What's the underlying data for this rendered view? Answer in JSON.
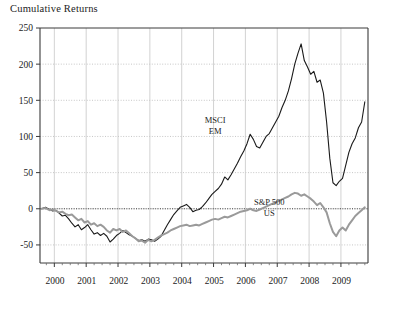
{
  "chart_data": {
    "type": "line",
    "title": "Cumulative Returns",
    "xlabel": "",
    "ylabel": "",
    "ylim": [
      -75,
      250
    ],
    "xlim": [
      1999.55,
      2009.85
    ],
    "grid": true,
    "legend_position": "inline-annotation",
    "yticks": [
      250,
      200,
      150,
      100,
      50,
      0,
      -50
    ],
    "ytick_labels": [
      "250",
      "200",
      "150",
      "100",
      "50",
      "0",
      "-50"
    ],
    "xticks": [
      2000,
      2001,
      2002,
      2003,
      2004,
      2005,
      2006,
      2007,
      2008,
      2009
    ],
    "xtick_labels": [
      "2000",
      "2001",
      "2002",
      "2003",
      "2004",
      "2005",
      "2006",
      "2007",
      "2008",
      "2009"
    ],
    "minor_ticks_per_year": 4,
    "zero_reference_line": 0,
    "annotations": [
      {
        "name": "msci-em-label",
        "text_lines": [
          "MSCI",
          "EM"
        ],
        "x": 2005.05,
        "y": 118
      },
      {
        "name": "sp500-label",
        "text_lines": [
          "S&P 500",
          "US"
        ],
        "x": 2006.75,
        "y": 5
      }
    ],
    "series": [
      {
        "name": "MSCI EM",
        "color": "#1a1a1a",
        "width": 1.1,
        "x": [
          1999.6,
          1999.72,
          1999.85,
          1999.95,
          2000.05,
          2000.15,
          2000.25,
          2000.35,
          2000.45,
          2000.55,
          2000.65,
          2000.75,
          2000.85,
          2000.95,
          2001.05,
          2001.15,
          2001.25,
          2001.35,
          2001.45,
          2001.55,
          2001.65,
          2001.75,
          2001.85,
          2001.95,
          2002.05,
          2002.15,
          2002.25,
          2002.35,
          2002.45,
          2002.55,
          2002.65,
          2002.75,
          2002.85,
          2002.95,
          2003.05,
          2003.15,
          2003.25,
          2003.35,
          2003.45,
          2003.55,
          2003.65,
          2003.75,
          2003.85,
          2003.95,
          2004.05,
          2004.15,
          2004.25,
          2004.35,
          2004.45,
          2004.55,
          2004.65,
          2004.75,
          2004.85,
          2004.95,
          2005.05,
          2005.15,
          2005.25,
          2005.35,
          2005.45,
          2005.55,
          2005.65,
          2005.75,
          2005.85,
          2005.95,
          2006.05,
          2006.15,
          2006.25,
          2006.35,
          2006.45,
          2006.55,
          2006.65,
          2006.75,
          2006.85,
          2006.95,
          2007.05,
          2007.15,
          2007.25,
          2007.35,
          2007.45,
          2007.55,
          2007.65,
          2007.75,
          2007.85,
          2007.95,
          2008.05,
          2008.15,
          2008.25,
          2008.35,
          2008.45,
          2008.55,
          2008.65,
          2008.75,
          2008.85,
          2008.95,
          2009.05,
          2009.15,
          2009.25,
          2009.35,
          2009.45,
          2009.55,
          2009.65,
          2009.75
        ],
        "y": [
          0,
          2,
          -1,
          -3,
          -2,
          -6,
          -10,
          -9,
          -14,
          -20,
          -25,
          -22,
          -29,
          -26,
          -22,
          -29,
          -35,
          -33,
          -37,
          -34,
          -38,
          -46,
          -42,
          -37,
          -34,
          -30,
          -33,
          -36,
          -38,
          -41,
          -44,
          -43,
          -45,
          -42,
          -43,
          -45,
          -42,
          -38,
          -30,
          -22,
          -15,
          -8,
          -3,
          2,
          4,
          6,
          2,
          -4,
          -2,
          -1,
          3,
          8,
          14,
          20,
          24,
          28,
          34,
          44,
          40,
          47,
          55,
          63,
          72,
          80,
          90,
          103,
          96,
          86,
          84,
          92,
          100,
          104,
          112,
          120,
          128,
          140,
          150,
          163,
          180,
          200,
          215,
          228,
          205,
          196,
          186,
          190,
          175,
          178,
          160,
          120,
          70,
          36,
          32,
          38,
          42,
          60,
          78,
          90,
          98,
          112,
          120,
          148
        ]
      },
      {
        "name": "S&P 500 US",
        "color": "#9a9a9a",
        "width": 2.0,
        "x": [
          1999.6,
          1999.72,
          1999.85,
          1999.95,
          2000.05,
          2000.15,
          2000.25,
          2000.35,
          2000.45,
          2000.55,
          2000.65,
          2000.75,
          2000.85,
          2000.95,
          2001.05,
          2001.15,
          2001.25,
          2001.35,
          2001.45,
          2001.55,
          2001.65,
          2001.75,
          2001.85,
          2001.95,
          2002.05,
          2002.15,
          2002.25,
          2002.35,
          2002.45,
          2002.55,
          2002.65,
          2002.75,
          2002.85,
          2002.95,
          2003.05,
          2003.15,
          2003.25,
          2003.35,
          2003.45,
          2003.55,
          2003.65,
          2003.75,
          2003.85,
          2003.95,
          2004.05,
          2004.15,
          2004.25,
          2004.35,
          2004.45,
          2004.55,
          2004.65,
          2004.75,
          2004.85,
          2004.95,
          2005.05,
          2005.15,
          2005.25,
          2005.35,
          2005.45,
          2005.55,
          2005.65,
          2005.75,
          2005.85,
          2005.95,
          2006.05,
          2006.15,
          2006.25,
          2006.35,
          2006.45,
          2006.55,
          2006.65,
          2006.75,
          2006.85,
          2006.95,
          2007.05,
          2007.15,
          2007.25,
          2007.35,
          2007.45,
          2007.55,
          2007.65,
          2007.75,
          2007.85,
          2007.95,
          2008.05,
          2008.15,
          2008.25,
          2008.35,
          2008.45,
          2008.55,
          2008.65,
          2008.75,
          2008.85,
          2008.95,
          2009.05,
          2009.15,
          2009.25,
          2009.35,
          2009.45,
          2009.55,
          2009.65,
          2009.75
        ],
        "y": [
          0,
          1,
          -2,
          -1,
          -3,
          -5,
          -4,
          -7,
          -9,
          -8,
          -12,
          -16,
          -14,
          -19,
          -17,
          -22,
          -20,
          -24,
          -22,
          -25,
          -30,
          -33,
          -28,
          -30,
          -28,
          -32,
          -30,
          -34,
          -38,
          -41,
          -45,
          -44,
          -47,
          -43,
          -45,
          -43,
          -40,
          -37,
          -35,
          -33,
          -30,
          -28,
          -26,
          -24,
          -23,
          -22,
          -24,
          -23,
          -22,
          -23,
          -21,
          -19,
          -17,
          -15,
          -14,
          -15,
          -13,
          -11,
          -12,
          -10,
          -8,
          -6,
          -4,
          -3,
          -2,
          0,
          -2,
          -3,
          -1,
          1,
          3,
          5,
          7,
          9,
          11,
          13,
          15,
          17,
          20,
          22,
          21,
          18,
          20,
          17,
          14,
          10,
          5,
          8,
          2,
          -5,
          -20,
          -32,
          -38,
          -30,
          -26,
          -30,
          -22,
          -16,
          -10,
          -6,
          -2,
          2
        ]
      }
    ]
  }
}
